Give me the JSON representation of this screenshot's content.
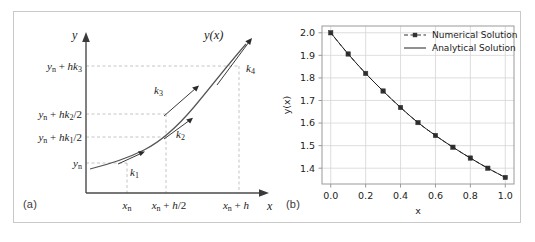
{
  "figure": {
    "panels": [
      {
        "id": "a",
        "label": "(a)"
      },
      {
        "id": "b",
        "label": "(b)"
      }
    ]
  },
  "panel_a": {
    "label": "(a)",
    "axis": {
      "y_axis_name": "y",
      "x_axis_name": "x",
      "curve_label": "y(x)"
    },
    "y_ticks": [
      {
        "id": "yn_hk3",
        "label": "y",
        "sub": "n",
        "rest": " + hk",
        "rest_sub": "3",
        "tail": ""
      },
      {
        "id": "yn_hk2h",
        "label": "y",
        "sub": "n",
        "rest": " + hk",
        "rest_sub": "2",
        "tail": "/2"
      },
      {
        "id": "yn_hk1h",
        "label": "y",
        "sub": "n",
        "rest": " + hk",
        "rest_sub": "1",
        "tail": "/2"
      },
      {
        "id": "yn",
        "label": "y",
        "sub": "n",
        "rest": "",
        "rest_sub": "",
        "tail": ""
      }
    ],
    "y_tick_text": [
      "y_n + hk_3",
      "y_n + hk_2/2",
      "y_n + hk_1/2",
      "y_n"
    ],
    "x_ticks": [
      {
        "id": "xn",
        "label": "x",
        "sub": "n",
        "tail": ""
      },
      {
        "id": "xn_h2",
        "label": "x",
        "sub": "n",
        "tail": " + h/2"
      },
      {
        "id": "xn_h",
        "label": "x",
        "sub": "n",
        "tail": " + h"
      }
    ],
    "x_tick_text": [
      "x_n",
      "x_n + h/2",
      "x_n + h"
    ],
    "slope_arrows": [
      {
        "id": "k1",
        "label": "k",
        "sub": "1"
      },
      {
        "id": "k2",
        "label": "k",
        "sub": "2"
      },
      {
        "id": "k3",
        "label": "k",
        "sub": "3"
      },
      {
        "id": "k4",
        "label": "k",
        "sub": "4"
      }
    ],
    "colors": {
      "axis": "#4a4a4a",
      "curve": "#555555",
      "guide": "#b5b5b5",
      "arrow": "#3a3a3a",
      "text": "#1c1c1c"
    }
  },
  "chart_data": {
    "type": "line",
    "title": "",
    "xlabel": "x",
    "ylabel": "y(x)",
    "xlim": [
      -0.05,
      1.05
    ],
    "ylim": [
      1.33,
      2.03
    ],
    "xticks": [
      0.0,
      0.2,
      0.4,
      0.6,
      0.8,
      1.0
    ],
    "xtick_labels": [
      "0.0",
      "0.2",
      "0.4",
      "0.6",
      "0.8",
      "1.0"
    ],
    "yticks": [
      1.4,
      1.5,
      1.6,
      1.7,
      1.8,
      1.9,
      2.0
    ],
    "ytick_labels": [
      "1.4",
      "1.5",
      "1.6",
      "1.7",
      "1.8",
      "1.9",
      "2.0"
    ],
    "grid": true,
    "legend_position": "upper right",
    "x": [
      0.0,
      0.1,
      0.2,
      0.3,
      0.4,
      0.5,
      0.6,
      0.7,
      0.8,
      0.9,
      1.0
    ],
    "series": [
      {
        "name": "Numerical Solution",
        "style": "dashed-marker",
        "marker": "square",
        "color": "#333333",
        "values": [
          2.0,
          1.906,
          1.82,
          1.742,
          1.669,
          1.602,
          1.545,
          1.493,
          1.445,
          1.4,
          1.359
        ]
      },
      {
        "name": "Analytical Solution",
        "style": "solid",
        "marker": "none",
        "color": "#222222",
        "values": [
          2.0,
          1.906,
          1.82,
          1.742,
          1.669,
          1.602,
          1.545,
          1.493,
          1.445,
          1.4,
          1.359
        ]
      }
    ],
    "legend": [
      "Numerical Solution",
      "Analytical Solution"
    ],
    "colors": {
      "grid": "#d6d6d6",
      "frame": "#9a9a9a",
      "text": "#222222"
    }
  }
}
